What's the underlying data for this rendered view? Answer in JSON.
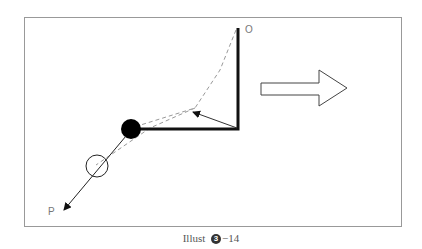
{
  "figure": {
    "labels": {
      "pivot": "O",
      "direction": "P"
    },
    "caption": {
      "prefix": "Illust",
      "badge": "3",
      "suffix": "−14"
    },
    "icons": [
      "right-arrow-icon"
    ]
  }
}
